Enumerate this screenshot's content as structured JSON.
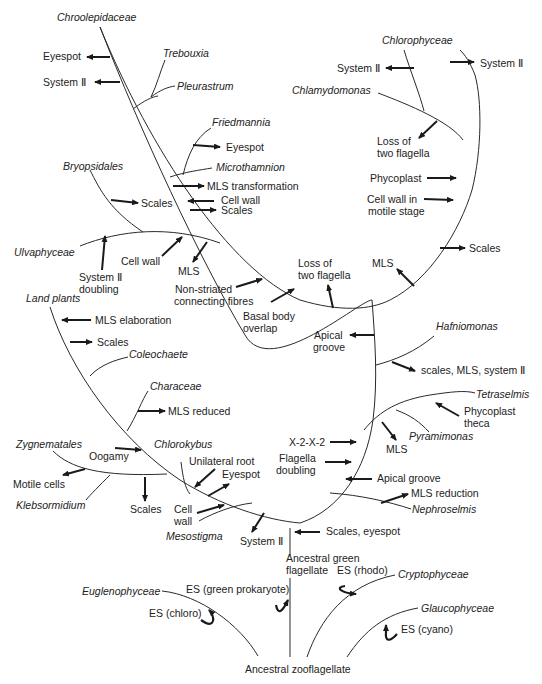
{
  "diagram": {
    "taxa": {
      "chroolepidaceae": "Chroolepidaceae",
      "trebouxia": "Trebouxia",
      "pleurastrum": "Pleurastrum",
      "friedmannia": "Friedmannia",
      "microthamnion": "Microthamnion",
      "bryopsidales": "Bryopsidales",
      "ulvaphyceae": "Ulvaphyceae",
      "land_plants": "Land plants",
      "coleochaete": "Coleochaete",
      "characeae": "Characeae",
      "zygnematales": "Zygnematales",
      "chlorokybus": "Chlorokybus",
      "klebsormidium": "Klebsormidium",
      "mesostigma": "Mesostigma",
      "chlorophyceae": "Chlorophyceae",
      "chlamydomonas": "Chlamydomonas",
      "hafniomonas": "Hafniomonas",
      "tetraselmis": "Tetraselmis",
      "pyramimonas": "Pyramimonas",
      "nephroselmis": "Nephroselmis",
      "euglenophyceae": "Euglenophyceae",
      "cryptophyceae": "Cryptophyceae",
      "glaucophyceae": "Glaucophyceae"
    },
    "characters": {
      "eyespot_chroo": "Eyespot",
      "system2_chroo": "System Ⅱ",
      "eyespot_fried": "Eyespot",
      "mls_transformation": "MLS transformation",
      "cell_wall_1": "Cell wall",
      "scales_1": "Scales",
      "scales_bryop": "Scales",
      "cell_wall_ulva": "Cell wall",
      "mls_ulva": "MLS",
      "system2_doubling_1": "System Ⅱ",
      "system2_doubling_2": "doubling",
      "nonstriated_1": "Non-striated",
      "nonstriated_2": "connecting fibres",
      "basal_body_1": "Basal body",
      "basal_body_2": "overlap",
      "loss_flagella_mid_1": "Loss of",
      "loss_flagella_mid_2": "two flagella",
      "mls_right": "MLS",
      "apical_groove_1": "Apical",
      "apical_groove_2": "groove",
      "mls_elaboration": "MLS elaboration",
      "scales_land": "Scales",
      "mls_reduced": "MLS reduced",
      "oogamy": "Oogamy",
      "motile_cells": "Motile cells",
      "scales_zyg": "Scales",
      "unilateral_root": "Unilateral root",
      "eyespot_chlorok": "Eyespot",
      "cell_wall_bottom_1": "Cell",
      "cell_wall_bottom_2": "wall",
      "system2_bottom": "System Ⅱ",
      "system2_chloro_left": "System Ⅱ",
      "system2_chloro_right": "System Ⅱ",
      "loss_flagella_chlamy_1": "Loss of",
      "loss_flagella_chlamy_2": "two flagella",
      "phycoplast": "Phycoplast",
      "cell_wall_motile_1": "Cell wall in",
      "cell_wall_motile_2": "motile stage",
      "scales_right": "Scales",
      "scales_mls_system2": "scales, MLS, system Ⅱ",
      "phycoplast_theca_1": "Phycoplast",
      "phycoplast_theca_2": "theca",
      "mls_pyram": "MLS",
      "x2x2": "X-2-X-2",
      "flagella_doubling_1": "Flagella",
      "flagella_doubling_2": "doubling",
      "apical_groove_long": "Apical groove",
      "mls_reduction": "MLS reduction",
      "scales_eyespot": "Scales, eyespot",
      "ancestral_green_1": "Ancestral green",
      "ancestral_green_2": "flagellate",
      "es_rhodo": "ES (rhodo)",
      "es_green_prok": "ES (green prokaryote)",
      "es_chloro": "ES (chloro)",
      "es_cyano": "ES (cyano)",
      "ancestral_zoo": "Ancestral zooflagellate"
    }
  }
}
